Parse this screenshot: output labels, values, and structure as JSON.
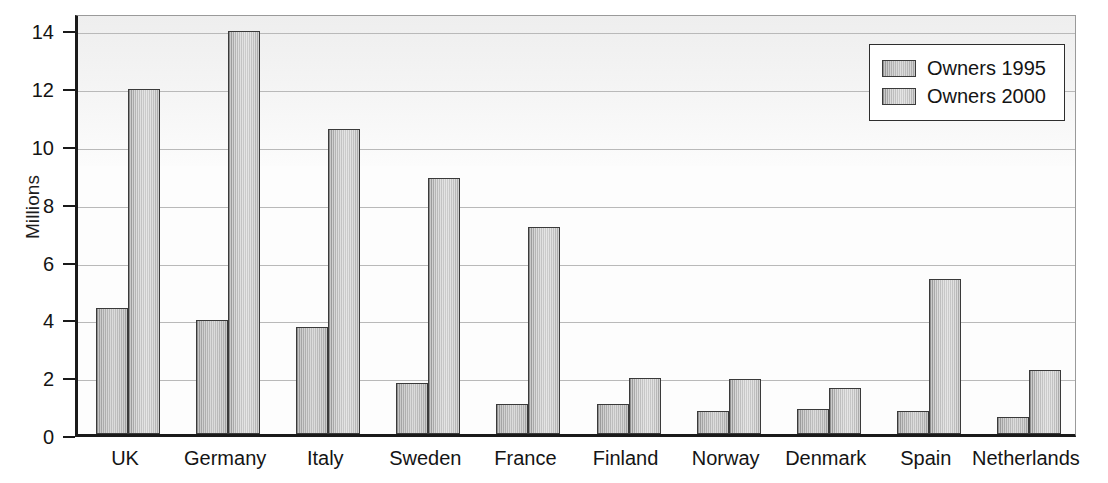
{
  "chart_data": {
    "type": "bar",
    "title": "",
    "xlabel": "",
    "ylabel": "Millions",
    "ylim": [
      0,
      14.6
    ],
    "yticks": [
      0,
      2,
      4,
      6,
      8,
      10,
      12,
      14
    ],
    "ytick_labels": [
      "0",
      "2",
      "4",
      "6",
      "8",
      "10",
      "12",
      "14"
    ],
    "grid": true,
    "legend_position": "top-right",
    "categories": [
      "UK",
      "Germany",
      "Italy",
      "Sweden",
      "France",
      "Finland",
      "Norway",
      "Denmark",
      "Spain",
      "Netherlands"
    ],
    "series": [
      {
        "name": "Owners 1995",
        "color": "#b0b0b0",
        "values": [
          4.35,
          3.95,
          3.7,
          1.75,
          1.05,
          1.05,
          0.8,
          0.85,
          0.8,
          0.6
        ]
      },
      {
        "name": "Owners 2000",
        "color": "#bcbcbc",
        "values": [
          11.95,
          13.95,
          10.55,
          8.85,
          7.15,
          1.95,
          1.9,
          1.6,
          5.35,
          2.2
        ]
      }
    ]
  },
  "legend": {
    "items": [
      {
        "label": "Owners 1995"
      },
      {
        "label": "Owners 2000"
      }
    ]
  },
  "axes": {
    "y_title": "Millions"
  }
}
